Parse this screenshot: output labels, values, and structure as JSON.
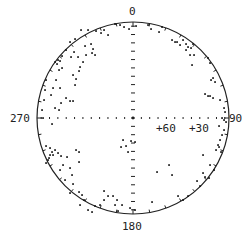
{
  "chart_data": {
    "type": "scatter",
    "projection": "stereonet (polar equal-area)",
    "title": "",
    "center_px": [
      133,
      118
    ],
    "radius_px": 96,
    "azimuth_labels": [
      {
        "text": "0",
        "angle": 0
      },
      {
        "text": "90",
        "angle": 90
      },
      {
        "text": "180",
        "angle": 180
      },
      {
        "text": "270",
        "angle": 270
      }
    ],
    "dip_markers": [
      {
        "text": "+60",
        "x": 156,
        "y": 128
      },
      {
        "text": "+30",
        "x": 189,
        "y": 128
      }
    ],
    "axis_ticks_per_half": 11,
    "perimeter_ticks_deg": 10,
    "colors": {
      "line": "#222222",
      "point": "#111111",
      "background": "#ffffff"
    },
    "points_px": [
      [
        115,
        24
      ],
      [
        120,
        25
      ],
      [
        124,
        27
      ],
      [
        129,
        29
      ],
      [
        136,
        26
      ],
      [
        148,
        25
      ],
      [
        151,
        29
      ],
      [
        159,
        32
      ],
      [
        162,
        27
      ],
      [
        104,
        30
      ],
      [
        108,
        35
      ],
      [
        101,
        33
      ],
      [
        96,
        31
      ],
      [
        91,
        44
      ],
      [
        85,
        46
      ],
      [
        93,
        49
      ],
      [
        92,
        53
      ],
      [
        86,
        55
      ],
      [
        95,
        55
      ],
      [
        81,
        30
      ],
      [
        88,
        30
      ],
      [
        75,
        39
      ],
      [
        70,
        42
      ],
      [
        66,
        50
      ],
      [
        62,
        56
      ],
      [
        58,
        60
      ],
      [
        55,
        62
      ],
      [
        57,
        64
      ],
      [
        60,
        61
      ],
      [
        74,
        52
      ],
      [
        71,
        57
      ],
      [
        78,
        57
      ],
      [
        83,
        62
      ],
      [
        80,
        67
      ],
      [
        79,
        71
      ],
      [
        73,
        75
      ],
      [
        76,
        79
      ],
      [
        75,
        85
      ],
      [
        62,
        68
      ],
      [
        59,
        70
      ],
      [
        56,
        80
      ],
      [
        53,
        88
      ],
      [
        51,
        95
      ],
      [
        60,
        88
      ],
      [
        66,
        98
      ],
      [
        70,
        101
      ],
      [
        73,
        101
      ],
      [
        61,
        103
      ],
      [
        46,
        80
      ],
      [
        45,
        90
      ],
      [
        44,
        100
      ],
      [
        42,
        110
      ],
      [
        43,
        118
      ],
      [
        52,
        124
      ],
      [
        59,
        110
      ],
      [
        55,
        108
      ],
      [
        172,
        40
      ],
      [
        175,
        42
      ],
      [
        177,
        42
      ],
      [
        180,
        45
      ],
      [
        183,
        40
      ],
      [
        186,
        44
      ],
      [
        188,
        47
      ],
      [
        191,
        48
      ],
      [
        193,
        44
      ],
      [
        190,
        55
      ],
      [
        194,
        55
      ],
      [
        186,
        50
      ],
      [
        192,
        65
      ],
      [
        208,
        58
      ],
      [
        210,
        63
      ],
      [
        213,
        78
      ],
      [
        215,
        82
      ],
      [
        211,
        80
      ],
      [
        205,
        94
      ],
      [
        208,
        96
      ],
      [
        210,
        96
      ],
      [
        213,
        98
      ],
      [
        220,
        100
      ],
      [
        224,
        108
      ],
      [
        225,
        112
      ],
      [
        222,
        118
      ],
      [
        224,
        120
      ],
      [
        226,
        122
      ],
      [
        219,
        126
      ],
      [
        224,
        130
      ],
      [
        222,
        135
      ],
      [
        220,
        140
      ],
      [
        218,
        145
      ],
      [
        216,
        150
      ],
      [
        219,
        147
      ],
      [
        221,
        152
      ],
      [
        210,
        165
      ],
      [
        214,
        170
      ],
      [
        203,
        155
      ],
      [
        203,
        173
      ],
      [
        205,
        177
      ],
      [
        209,
        178
      ],
      [
        197,
        181
      ],
      [
        200,
        186
      ],
      [
        188,
        196
      ],
      [
        183,
        200
      ],
      [
        178,
        196
      ],
      [
        172,
        175
      ],
      [
        169,
        165
      ],
      [
        157,
        172
      ],
      [
        152,
        202
      ],
      [
        135,
        210
      ],
      [
        130,
        208
      ],
      [
        122,
        205
      ],
      [
        118,
        211
      ],
      [
        115,
        205
      ],
      [
        117,
        200
      ],
      [
        113,
        196
      ],
      [
        104,
        191
      ],
      [
        108,
        196
      ],
      [
        104,
        200
      ],
      [
        100,
        205
      ],
      [
        95,
        206
      ],
      [
        92,
        212
      ],
      [
        88,
        210
      ],
      [
        84,
        200
      ],
      [
        82,
        195
      ],
      [
        79,
        192
      ],
      [
        80,
        205
      ],
      [
        70,
        193
      ],
      [
        65,
        180
      ],
      [
        73,
        184
      ],
      [
        72,
        175
      ],
      [
        70,
        168
      ],
      [
        60,
        170
      ],
      [
        63,
        165
      ],
      [
        67,
        157
      ],
      [
        76,
        150
      ],
      [
        79,
        152
      ],
      [
        79,
        162
      ],
      [
        61,
        156
      ],
      [
        58,
        153
      ],
      [
        55,
        150
      ],
      [
        52,
        152
      ],
      [
        50,
        155
      ],
      [
        53,
        155
      ],
      [
        49,
        158
      ],
      [
        50,
        148
      ],
      [
        46,
        146
      ],
      [
        48,
        160
      ],
      [
        46,
        163
      ],
      [
        123,
        140
      ],
      [
        121,
        147
      ],
      [
        126,
        146
      ],
      [
        128,
        152
      ],
      [
        131,
        141
      ],
      [
        135,
        142
      ]
    ]
  }
}
